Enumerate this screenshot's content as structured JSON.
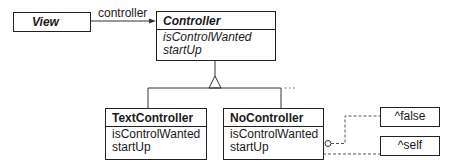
{
  "diagram": {
    "classes": [
      {
        "id": "view",
        "name": "View",
        "abstract": true,
        "operations": []
      },
      {
        "id": "controller",
        "name": "Controller",
        "abstract": true,
        "operations": [
          "isControlWanted",
          "startUp"
        ]
      },
      {
        "id": "textcontroller",
        "name": "TextController",
        "abstract": false,
        "operations": [
          "isControlWanted",
          "startUp"
        ]
      },
      {
        "id": "nocontroller",
        "name": "NoController",
        "abstract": false,
        "operations": [
          "isControlWanted",
          "startUp"
        ]
      }
    ],
    "association": {
      "from": "View",
      "to": "Controller",
      "label": "controller"
    },
    "inheritance": {
      "parent": "Controller",
      "children": [
        "TextController",
        "NoController"
      ],
      "more": "..."
    },
    "notes": [
      {
        "attached_to": "NoController.isControlWanted",
        "text": "^false"
      },
      {
        "attached_to": "NoController.startUp",
        "text": "^self"
      }
    ]
  }
}
